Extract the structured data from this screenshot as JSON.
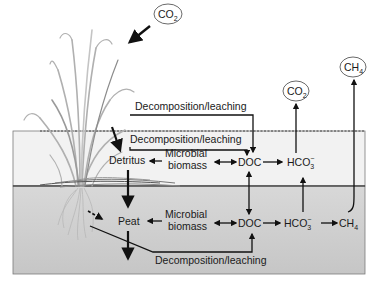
{
  "diagram": {
    "colors": {
      "water": "#f1f1f1",
      "soil": "#cfcfcf",
      "box_border": "#6a6a6a",
      "plant": "#b5b5b5",
      "arrow": "#111111"
    },
    "atmosphere": {
      "co2_in": {
        "label": "CO",
        "sub": "2"
      },
      "co2_out": {
        "label": "CO",
        "sub": "2"
      },
      "ch4_out": {
        "label": "CH",
        "sub": "4"
      }
    },
    "upper_flow_label": "Decomposition/leaching",
    "water_layer": {
      "flow_label": "Decomposition/leaching",
      "detritus": "Detritus",
      "microbial_line1": "Microbial",
      "microbial_line2": "biomass",
      "doc": "DOC",
      "hco3": "HCO",
      "hco3_sub": "3",
      "hco3_sup": "−"
    },
    "peat_layer": {
      "peat": "Peat",
      "microbial_line1": "Microbial",
      "microbial_line2": "biomass",
      "doc": "DOC",
      "hco3": "HCO",
      "hco3_sub": "3",
      "hco3_sup": "−",
      "ch4": "CH",
      "ch4_sub": "4",
      "flow_label": "Decomposition/leaching"
    }
  }
}
